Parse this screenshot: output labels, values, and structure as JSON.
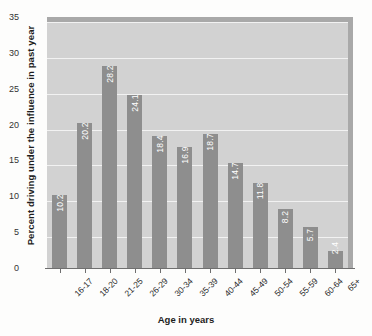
{
  "chart_data": {
    "type": "bar",
    "title": "",
    "xlabel": "Age in years",
    "ylabel": "Percent driving under the influence in past year",
    "categories": [
      "16-17",
      "18-20",
      "21-25",
      "26-29",
      "30-34",
      "35-39",
      "40-44",
      "45-49",
      "50-54",
      "55-59",
      "60-64",
      "65+"
    ],
    "values": [
      10.2,
      20.2,
      28.2,
      24.1,
      18.4,
      16.9,
      18.7,
      14.7,
      11.8,
      8.2,
      5.7,
      2.4
    ],
    "value_labels": [
      "10.2",
      "20.2",
      "28.2",
      "24.1",
      "18.4",
      "16.9",
      "18.7",
      "14.7",
      "11.8",
      "8.2",
      "5.7",
      "2.4"
    ],
    "ylim": [
      0,
      35
    ],
    "yticks": [
      0,
      5,
      10,
      15,
      20,
      25,
      30,
      35
    ],
    "ytick_labels": [
      "0",
      "5",
      "10",
      "15",
      "20",
      "25",
      "30",
      "35"
    ],
    "grid": true,
    "legend": false,
    "bar_color": "#8e8e8e",
    "plot_background": "#d2d2d2",
    "gridline_color": "#f2f2f2",
    "frame_color": "#a9a9a9",
    "value_label_color": "#ffffff"
  }
}
